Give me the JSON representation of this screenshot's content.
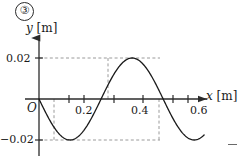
{
  "figure": {
    "number_label": "③"
  },
  "axes": {
    "y_axis_label": "y",
    "y_axis_unit": "[m]",
    "x_axis_label": "x",
    "x_axis_unit": "[m]",
    "origin_label": "O"
  },
  "ticks": {
    "y": [
      {
        "value": 0.02,
        "label": "0.02"
      },
      {
        "value": -0.02,
        "label": "−0.02"
      }
    ],
    "x": [
      {
        "value": 0.2,
        "label": "0.2"
      },
      {
        "value": 0.4,
        "label": "0.4"
      },
      {
        "value": 0.6,
        "label": "0.6"
      }
    ]
  },
  "misc": {
    "corner_dash": "—"
  },
  "colors": {
    "axis": "#2b2b2b",
    "curve": "#1a1a1a",
    "guide_dash": "#9a9a9a",
    "text": "#1a1a1a"
  },
  "chart_data": {
    "type": "line",
    "title": "",
    "xlabel": "x [m]",
    "ylabel": "y [m]",
    "xlim": [
      -0.02,
      0.68
    ],
    "ylim": [
      -0.026,
      0.026
    ],
    "grid": false,
    "legend": null,
    "wave": {
      "amplitude": 0.02,
      "wavelength": 0.5,
      "phase": "negative-sine",
      "zero_crossings": [
        0.0,
        0.25,
        0.5
      ],
      "maxima": [
        {
          "x": 0.3,
          "y": 0.02
        }
      ],
      "minima": [
        {
          "x": 0.05,
          "y": -0.02
        },
        {
          "x": 0.55,
          "y": -0.02
        }
      ]
    },
    "x": [
      0.0,
      0.025,
      0.05,
      0.075,
      0.1,
      0.125,
      0.15,
      0.175,
      0.2,
      0.225,
      0.25,
      0.275,
      0.3,
      0.325,
      0.35,
      0.375,
      0.4,
      0.425,
      0.45,
      0.475,
      0.5,
      0.525,
      0.55,
      0.575,
      0.6,
      0.625,
      0.65
    ],
    "y": [
      0.0,
      -0.0141,
      -0.02,
      -0.0141,
      0.0,
      0.0141,
      0.02,
      0.0141,
      0.0,
      -0.0141,
      -0.02,
      -0.0141,
      0.0,
      0.0141,
      0.02,
      0.0141,
      0.0,
      -0.0141,
      -0.02,
      -0.0141,
      0.0,
      0.0141,
      0.02,
      0.0141,
      0.0,
      -0.0141,
      -0.02
    ],
    "guide_lines": {
      "horizontal": [
        0.02,
        -0.02
      ],
      "vertical": [
        0.05,
        0.3,
        0.55
      ]
    },
    "x_tick_values": [
      0.0,
      0.1,
      0.2,
      0.3,
      0.4,
      0.5,
      0.6
    ],
    "x_tick_labels_shown": [
      "0.2",
      "0.4",
      "0.6"
    ],
    "y_tick_values": [
      0.02,
      -0.02
    ],
    "y_tick_labels_shown": [
      "0.02",
      "−0.02"
    ]
  }
}
